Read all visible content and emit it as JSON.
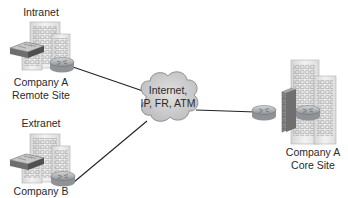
{
  "diagram": {
    "type": "network-topology",
    "colors": {
      "line": "#222222",
      "cloud_fill": "#cfcfd0",
      "building": "#e6e6e6",
      "firewall": "#8a8a8a",
      "router": "#b9bcbf"
    },
    "sites": {
      "remote": {
        "category": "Intranet",
        "name_line1": "Company A",
        "name_line2": "Remote Site"
      },
      "partner": {
        "category": "Extranet",
        "name_line1": "Company B"
      },
      "core": {
        "name_line1": "Company A",
        "name_line2": "Core Site"
      }
    },
    "cloud": {
      "line1": "Internet,",
      "line2": "IP, FR, ATM"
    },
    "links": [
      {
        "from": "Company A Remote Site",
        "to": "Internet cloud"
      },
      {
        "from": "Company B",
        "to": "Internet cloud"
      },
      {
        "from": "Internet cloud",
        "to": "Company A Core Site"
      }
    ]
  }
}
